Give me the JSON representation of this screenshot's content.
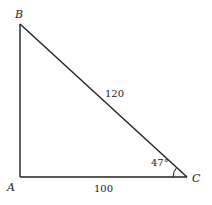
{
  "diagram": {
    "type": "right-triangle",
    "vertices": {
      "A": {
        "label": "A",
        "x": 20,
        "y": 177
      },
      "B": {
        "label": "B",
        "x": 20,
        "y": 24
      },
      "C": {
        "label": "C",
        "x": 187,
        "y": 177
      }
    },
    "sides": {
      "AC": {
        "label": "100"
      },
      "BC": {
        "label": "120"
      }
    },
    "angle_C": {
      "label": "47°"
    },
    "stroke_color": "#222222"
  }
}
